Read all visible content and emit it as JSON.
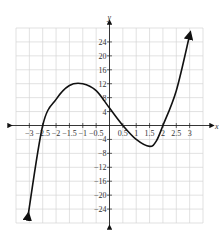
{
  "chart_data": {
    "type": "line",
    "title": "",
    "xlabel": "x",
    "ylabel": "y",
    "xlim": [
      -3.5,
      3.5
    ],
    "ylim": [
      -28,
      28
    ],
    "grid": true,
    "x_ticks": [
      -3,
      -2.5,
      -2,
      -1.5,
      -1,
      -0.5,
      0.5,
      1,
      1.5,
      2,
      2.5,
      3
    ],
    "x_tick_labels": [
      "−3",
      "−2.5",
      "−2",
      "−1.5",
      "−1",
      "−0.5",
      "0.5",
      "1",
      "1.5",
      "2",
      "2.5",
      "3"
    ],
    "y_ticks": [
      24,
      20,
      16,
      12,
      8,
      4,
      -4,
      -8,
      -12,
      -16,
      -20,
      -24
    ],
    "y_tick_labels": [
      "24",
      "20",
      "16",
      "12",
      "8",
      "4",
      "−4",
      "−8",
      "−12",
      "−16",
      "−20",
      "−24"
    ],
    "series": [
      {
        "name": "cubic",
        "x": [
          -3.05,
          -2.5,
          -2,
          -1.5,
          -1,
          -0.5,
          0,
          0.5,
          1,
          1.5,
          1.75,
          2,
          2.5,
          3
        ],
        "y": [
          -26,
          0,
          7.5,
          11.5,
          12,
          10,
          5,
          0,
          -4,
          -6,
          -4.5,
          0,
          10,
          26
        ]
      }
    ],
    "annotations": [
      "arrow at both ends of curve",
      "arrows on axes"
    ]
  },
  "labels": {
    "x_axis": "x",
    "y_axis": "y"
  }
}
